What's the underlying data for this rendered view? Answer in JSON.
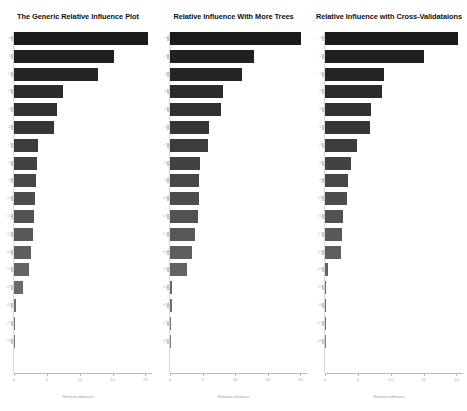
{
  "figure": {
    "background_color": "#ffffff",
    "bar_color_top": "#1a1a1a",
    "bar_color_bottom": "#7a7a7a",
    "axis_color": "#b9b9b9"
  },
  "panels": [
    {
      "id": "panel-generic",
      "title": "The Generic Relative Influence Plot",
      "xlabel": "Relative influence",
      "x_ticks": [
        "0",
        "5",
        "10",
        "15",
        "20"
      ],
      "y_tick_labels": [
        "v1",
        "v2",
        "v3",
        "v4",
        "v5",
        "v6",
        "v7",
        "v8",
        "v9",
        "v10",
        "v11",
        "v12",
        "v13",
        "v14",
        "v15",
        "v16",
        "v17",
        "v18"
      ],
      "values": [
        20.4,
        15.2,
        12.8,
        7.5,
        6.6,
        6.1,
        3.6,
        3.5,
        3.4,
        3.2,
        3.1,
        2.9,
        2.6,
        2.3,
        1.4,
        0.35,
        0.12,
        0.05
      ]
    },
    {
      "id": "panel-more-trees",
      "title": "Relative Influence With More Trees",
      "xlabel": "Relative influence",
      "x_ticks": [
        "0",
        "5",
        "10",
        "15",
        "20"
      ],
      "y_tick_labels": [
        "v1",
        "v2",
        "v3",
        "v4",
        "v5",
        "v6",
        "v7",
        "v8",
        "v9",
        "v10",
        "v11",
        "v12",
        "v13",
        "v14",
        "v15",
        "v16",
        "v17",
        "v18"
      ],
      "values": [
        20.1,
        12.8,
        11.0,
        8.1,
        7.8,
        6.0,
        5.8,
        4.6,
        4.5,
        4.4,
        4.3,
        3.8,
        3.4,
        2.6,
        0.35,
        0.33,
        0.1,
        0.06
      ]
    },
    {
      "id": "panel-cross-validation",
      "title": "Relative Influence with Cross-Validataions",
      "xlabel": "Relative influence",
      "x_ticks": [
        "0",
        "5",
        "10",
        "15",
        "20"
      ],
      "y_tick_labels": [
        "v1",
        "v2",
        "v3",
        "v4",
        "v5",
        "v6",
        "v7",
        "v8",
        "v9",
        "v10",
        "v11",
        "v12",
        "v13",
        "v14",
        "v15",
        "v16",
        "v17",
        "v18"
      ],
      "values": [
        20.2,
        15.1,
        9.0,
        8.7,
        7.0,
        6.9,
        4.8,
        4.0,
        3.5,
        3.4,
        2.7,
        2.6,
        2.5,
        0.45,
        0.08,
        0.05,
        0.04,
        0.03
      ]
    }
  ],
  "chart_data": {
    "type": "bar",
    "orientation": "horizontal",
    "panel_count": 3,
    "grid": false,
    "legend": "none",
    "xlabel": "Relative influence",
    "ylabel": "",
    "xlim": [
      0,
      21
    ],
    "x_ticks": [
      0,
      5,
      10,
      15,
      20
    ],
    "titles": [
      "The Generic Relative Influence Plot",
      "Relative Influence With More Trees",
      "Relative Influence with Cross-Validataions"
    ],
    "series": [
      {
        "name": "The Generic Relative Influence Plot",
        "values": [
          20.4,
          15.2,
          12.8,
          7.5,
          6.6,
          6.1,
          3.6,
          3.5,
          3.4,
          3.2,
          3.1,
          2.9,
          2.6,
          2.3,
          1.4,
          0.35,
          0.12,
          0.05
        ]
      },
      {
        "name": "Relative Influence With More Trees",
        "values": [
          20.1,
          12.8,
          11.0,
          8.1,
          7.8,
          6.0,
          5.8,
          4.6,
          4.5,
          4.4,
          4.3,
          3.8,
          3.4,
          2.6,
          0.35,
          0.33,
          0.1,
          0.06
        ]
      },
      {
        "name": "Relative Influence with Cross-Validataions",
        "values": [
          20.2,
          15.1,
          9.0,
          8.7,
          7.0,
          6.9,
          4.8,
          4.0,
          3.5,
          3.4,
          2.7,
          2.6,
          2.5,
          0.45,
          0.08,
          0.05,
          0.04,
          0.03
        ]
      }
    ],
    "categories": [
      "v1",
      "v2",
      "v3",
      "v4",
      "v5",
      "v6",
      "v7",
      "v8",
      "v9",
      "v10",
      "v11",
      "v12",
      "v13",
      "v14",
      "v15",
      "v16",
      "v17",
      "v18"
    ]
  }
}
